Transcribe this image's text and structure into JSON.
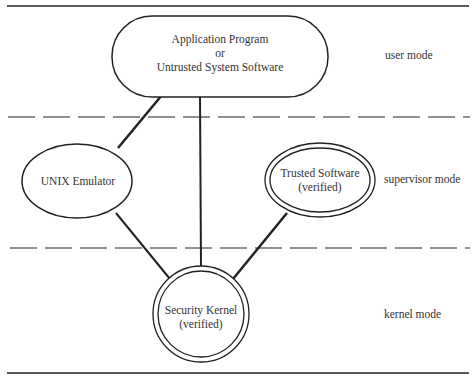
{
  "diagram": {
    "nodes": {
      "application": {
        "line1": "Application Program",
        "line2": "or",
        "line3": "Untrusted System Software"
      },
      "unix": {
        "label": "UNIX Emulator"
      },
      "trusted": {
        "line1": "Trusted Software",
        "line2": "(verified)"
      },
      "kernel": {
        "line1": "Security Kernel",
        "line2": "(verified)"
      }
    },
    "modes": {
      "user": "user mode",
      "supervisor": "supervisor mode",
      "kernel": "kernel mode"
    },
    "edges": [
      {
        "from": "application",
        "to": "unix"
      },
      {
        "from": "application",
        "to": "kernel"
      },
      {
        "from": "unix",
        "to": "kernel"
      },
      {
        "from": "trusted",
        "to": "kernel"
      }
    ],
    "colors": {
      "ink": "#222222",
      "text": "#333333",
      "background": "#ffffff"
    }
  }
}
